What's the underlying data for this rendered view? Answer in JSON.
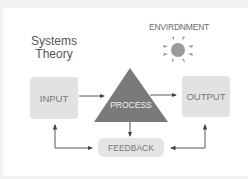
{
  "diagram": {
    "title_line1": "Systems",
    "title_line2": "Theory",
    "environment_label": "ENVIRDNMENT",
    "nodes": {
      "input": "INPUT",
      "process": "PROCESS",
      "output": "OUTPUT",
      "feedback": "FEEDBACK"
    },
    "edges": [
      {
        "from": "input",
        "to": "process"
      },
      {
        "from": "process",
        "to": "output"
      },
      {
        "from": "process",
        "to": "feedback"
      },
      {
        "from": "output",
        "to": "feedback"
      },
      {
        "from": "feedback",
        "to": "input"
      }
    ],
    "colors": {
      "process_fill": "#7a7a7a",
      "box_fill": "#e2e2e2",
      "line": "#444444",
      "sun": "#9a9a9a"
    }
  }
}
